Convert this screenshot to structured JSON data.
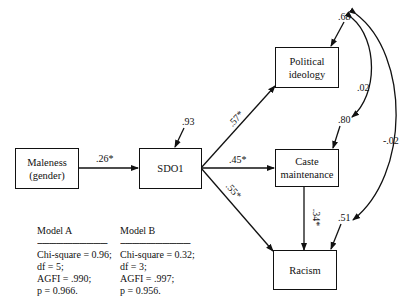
{
  "nodes": {
    "maleness": {
      "line1": "Maleness",
      "line2": "(gender)"
    },
    "sdo1": {
      "label": "SDO1"
    },
    "political": {
      "line1": "Political",
      "line2": "ideology"
    },
    "caste": {
      "line1": "Caste",
      "line2": "maintenance"
    },
    "racism": {
      "label": "Racism"
    }
  },
  "paths": {
    "maleness_sdo1": ".26*",
    "sdo1_political": ".57*",
    "sdo1_caste": ".45*",
    "sdo1_racism": ".55*",
    "caste_racism": ".34*"
  },
  "errors": {
    "sdo1": ".93",
    "political": ".68",
    "caste": ".80",
    "racism": ".51"
  },
  "covariances": {
    "political_caste": ".02",
    "political_racism": "-.02"
  },
  "models": [
    {
      "title": "Model A",
      "dash": "------------------------------",
      "lines": [
        "Chi-square = 0.96;",
        "df = 5;",
        "AGFI = .990;",
        "p = 0.966."
      ]
    },
    {
      "title": "Model B",
      "dash": "------------------------------",
      "lines": [
        "Chi-square = 0.32;",
        "df = 3;",
        "AGFI = .997;",
        "p = 0.956."
      ]
    }
  ]
}
